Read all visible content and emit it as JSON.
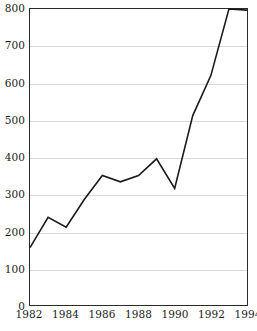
{
  "chart_data": {
    "type": "line",
    "title": "",
    "subtitle": "",
    "xlabel": "",
    "ylabel": "",
    "x": [
      1982,
      1983,
      1984,
      1985,
      1986,
      1987,
      1988,
      1989,
      1990,
      1991,
      1992,
      1993,
      1994
    ],
    "values": [
      155,
      237,
      210,
      285,
      350,
      333,
      350,
      395,
      315,
      512,
      620,
      800,
      797
    ],
    "series": [
      {
        "name": "series-1",
        "values": [
          155,
          237,
          210,
          285,
          350,
          333,
          350,
          395,
          315,
          512,
          620,
          800,
          797
        ]
      }
    ],
    "xlim": [
      1982,
      1994
    ],
    "ylim": [
      0,
      800
    ],
    "x_tick_values": [
      1982,
      1984,
      1986,
      1988,
      1990,
      1992,
      1994
    ],
    "x_tick_labels": [
      "1982",
      "1984",
      "1986",
      "1988",
      "1990",
      "1992",
      "1994"
    ],
    "y_tick_values": [
      0,
      100,
      200,
      300,
      400,
      500,
      600,
      700,
      800
    ],
    "y_tick_labels": [
      "0",
      "100",
      "200",
      "300",
      "400",
      "500",
      "600",
      "700",
      "800"
    ],
    "grid": "horizontal",
    "grid_color": "#d9d9d9",
    "legend": "none",
    "line_color": "#1a1a1a",
    "line_width": 1.6,
    "frame_color": "#2a2a2a",
    "background": "#ffffff",
    "markers": "none",
    "annotations": []
  }
}
